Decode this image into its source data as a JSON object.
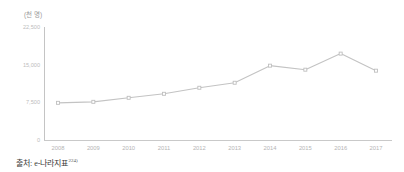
{
  "figure": {
    "unit_label": "(천 명)",
    "source_prefix": "출처:",
    "source_name": "e-나라지표",
    "source_footnote_marker": "224)"
  },
  "chart_data": {
    "type": "line",
    "title": "",
    "subtitle": "",
    "xlabel": "",
    "ylabel": "(천 명)",
    "unit": "천 명",
    "grid": false,
    "legend": "none",
    "marker": "square",
    "line_color": "#c3c3c3",
    "marker_color": "#bfbfbf",
    "axis_color": "#c4c4c4",
    "categories": [
      "2008",
      "2009",
      "2010",
      "2011",
      "2012",
      "2013",
      "2014",
      "2015",
      "2016",
      "2017"
    ],
    "x": [
      2008,
      2009,
      2010,
      2011,
      2012,
      2013,
      2014,
      2015,
      2016,
      2017
    ],
    "values": [
      7400,
      7600,
      8400,
      9200,
      10400,
      11400,
      14800,
      14000,
      17200,
      13800
    ],
    "ylim": [
      0,
      22500
    ],
    "yticks": [
      0,
      7500,
      15000,
      22500
    ],
    "ytick_labels": [
      "0",
      "7,500",
      "15,000",
      "22,500"
    ],
    "xlim": [
      2007.5,
      2017.5
    ],
    "series": [
      {
        "name": "",
        "values": [
          7400,
          7600,
          8400,
          9200,
          10400,
          11400,
          14800,
          14000,
          17200,
          13800
        ]
      }
    ]
  }
}
